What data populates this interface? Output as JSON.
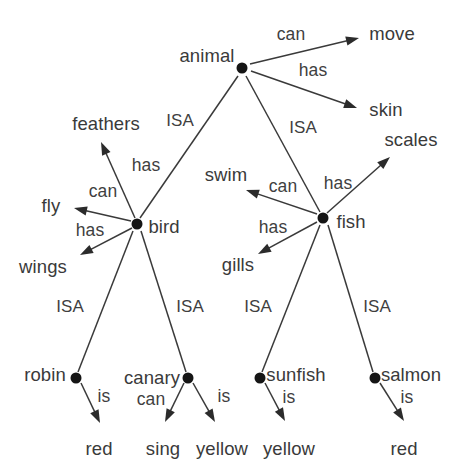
{
  "diagram": {
    "type": "semantic-network",
    "title": "",
    "background_color": "#ffffff",
    "line_color": "#3a3a3a",
    "node_color": "#151515",
    "text_color": "#3b3b3b",
    "nodes": [
      {
        "id": "animal",
        "label": "animal",
        "x": 242,
        "y": 68,
        "label_x": 207,
        "label_y": 56,
        "has_dot": true
      },
      {
        "id": "bird",
        "label": "bird",
        "x": 137,
        "y": 224,
        "label_x": 164,
        "label_y": 227,
        "has_dot": true
      },
      {
        "id": "fish",
        "label": "fish",
        "x": 323,
        "y": 218,
        "label_x": 351,
        "label_y": 222,
        "has_dot": true
      },
      {
        "id": "robin",
        "label": "robin",
        "x": 76,
        "y": 378,
        "label_x": 45,
        "label_y": 375,
        "has_dot": true
      },
      {
        "id": "canary",
        "label": "canary",
        "x": 188,
        "y": 378,
        "label_x": 152,
        "label_y": 378,
        "has_dot": true
      },
      {
        "id": "sunfish",
        "label": "sunfish",
        "x": 260,
        "y": 378,
        "label_x": 296,
        "label_y": 375,
        "has_dot": true
      },
      {
        "id": "salmon",
        "label": "salmon",
        "x": 375,
        "y": 378,
        "label_x": 411,
        "label_y": 375,
        "has_dot": true
      }
    ],
    "attributes": [
      {
        "id": "move",
        "label": "move",
        "label_x": 392,
        "label_y": 34,
        "arrow_x": 359,
        "arrow_y": 38
      },
      {
        "id": "skin",
        "label": "skin",
        "label_x": 386,
        "label_y": 110,
        "arrow_x": 357,
        "arrow_y": 108
      },
      {
        "id": "feathers",
        "label": "feathers",
        "label_x": 106,
        "label_y": 124,
        "arrow_x": 101,
        "arrow_y": 142
      },
      {
        "id": "scales",
        "label": "scales",
        "label_x": 411,
        "label_y": 140,
        "arrow_x": 390,
        "arrow_y": 157
      },
      {
        "id": "swim",
        "label": "swim",
        "label_x": 226,
        "label_y": 175,
        "arrow_x": 246,
        "arrow_y": 190
      },
      {
        "id": "fly",
        "label": "fly",
        "label_x": 51,
        "label_y": 206,
        "arrow_x": 74,
        "arrow_y": 208
      },
      {
        "id": "wings",
        "label": "wings",
        "label_x": 43,
        "label_y": 267,
        "arrow_x": 80,
        "arrow_y": 255
      },
      {
        "id": "gills",
        "label": "gills",
        "label_x": 238,
        "label_y": 265,
        "arrow_x": 258,
        "arrow_y": 254
      },
      {
        "id": "red1",
        "label": "red",
        "label_x": 99,
        "label_y": 449,
        "arrow_x": 100,
        "arrow_y": 423
      },
      {
        "id": "sing",
        "label": "sing",
        "label_x": 163,
        "label_y": 449,
        "arrow_x": 165,
        "arrow_y": 422
      },
      {
        "id": "yellow1",
        "label": "yellow",
        "label_x": 222,
        "label_y": 449,
        "arrow_x": 215,
        "arrow_y": 422
      },
      {
        "id": "yellow2",
        "label": "yellow",
        "label_x": 289,
        "label_y": 449,
        "arrow_x": 285,
        "arrow_y": 421
      },
      {
        "id": "red2",
        "label": "red",
        "label_x": 404,
        "label_y": 449,
        "arrow_x": 404,
        "arrow_y": 421
      }
    ],
    "edges": [
      {
        "id": "animal-can-move",
        "from": "animal",
        "to": "move",
        "relation": "can",
        "arrow": true,
        "x1": 250,
        "y1": 64,
        "x2": 359,
        "y2": 38,
        "label_x": 291,
        "label_y": 35
      },
      {
        "id": "animal-has-skin",
        "from": "animal",
        "to": "skin",
        "relation": "has",
        "arrow": true,
        "x1": 251,
        "y1": 71,
        "x2": 357,
        "y2": 108,
        "label_x": 313,
        "label_y": 71
      },
      {
        "id": "animal-isa-bird",
        "from": "animal",
        "to": "bird",
        "relation": "ISA",
        "arrow": false,
        "x1": 238,
        "y1": 76,
        "x2": 140,
        "y2": 218,
        "label_x": 180,
        "label_y": 120
      },
      {
        "id": "animal-isa-fish",
        "from": "animal",
        "to": "fish",
        "relation": "ISA",
        "arrow": false,
        "x1": 246,
        "y1": 76,
        "x2": 320,
        "y2": 212,
        "label_x": 303,
        "label_y": 127
      },
      {
        "id": "bird-has-feathers",
        "from": "bird",
        "to": "feathers",
        "relation": "has",
        "arrow": true,
        "x1": 135,
        "y1": 218,
        "x2": 101,
        "y2": 142,
        "label_x": 146,
        "label_y": 166
      },
      {
        "id": "bird-can-fly",
        "from": "bird",
        "to": "fly",
        "relation": "can",
        "arrow": true,
        "x1": 131,
        "y1": 221,
        "x2": 74,
        "y2": 208,
        "label_x": 103,
        "label_y": 192
      },
      {
        "id": "bird-has-wings",
        "from": "bird",
        "to": "wings",
        "relation": "has",
        "arrow": true,
        "x1": 132,
        "y1": 228,
        "x2": 80,
        "y2": 255,
        "label_x": 90,
        "label_y": 231
      },
      {
        "id": "bird-isa-robin",
        "from": "bird",
        "to": "robin",
        "relation": "ISA",
        "arrow": false,
        "x1": 133,
        "y1": 231,
        "x2": 78,
        "y2": 372,
        "label_x": 70,
        "label_y": 306
      },
      {
        "id": "bird-isa-canary",
        "from": "bird",
        "to": "canary",
        "relation": "ISA",
        "arrow": false,
        "x1": 141,
        "y1": 231,
        "x2": 186,
        "y2": 372,
        "label_x": 190,
        "label_y": 306
      },
      {
        "id": "fish-can-swim",
        "from": "fish",
        "to": "swim",
        "relation": "can",
        "arrow": true,
        "x1": 317,
        "y1": 214,
        "x2": 246,
        "y2": 190,
        "label_x": 283,
        "label_y": 187
      },
      {
        "id": "fish-has-scales",
        "from": "fish",
        "to": "scales",
        "relation": "has",
        "arrow": true,
        "x1": 327,
        "y1": 213,
        "x2": 390,
        "y2": 157,
        "label_x": 338,
        "label_y": 184
      },
      {
        "id": "fish-has-gills",
        "from": "fish",
        "to": "gills",
        "relation": "has",
        "arrow": true,
        "x1": 317,
        "y1": 222,
        "x2": 258,
        "y2": 254,
        "label_x": 273,
        "label_y": 228
      },
      {
        "id": "fish-isa-sunfish",
        "from": "fish",
        "to": "sunfish",
        "relation": "ISA",
        "arrow": false,
        "x1": 320,
        "y1": 225,
        "x2": 262,
        "y2": 372,
        "label_x": 258,
        "label_y": 306
      },
      {
        "id": "fish-isa-salmon",
        "from": "fish",
        "to": "salmon",
        "relation": "ISA",
        "arrow": false,
        "x1": 328,
        "y1": 225,
        "x2": 373,
        "y2": 372,
        "label_x": 377,
        "label_y": 306
      },
      {
        "id": "robin-is-red",
        "from": "robin",
        "to": "red1",
        "relation": "is",
        "arrow": true,
        "x1": 81,
        "y1": 383,
        "x2": 100,
        "y2": 423,
        "label_x": 104,
        "label_y": 397
      },
      {
        "id": "canary-can-sing",
        "from": "canary",
        "to": "sing",
        "relation": "can",
        "arrow": true,
        "x1": 184,
        "y1": 383,
        "x2": 165,
        "y2": 422,
        "label_x": 151,
        "label_y": 400
      },
      {
        "id": "canary-is-yellow",
        "from": "canary",
        "to": "yellow1",
        "relation": "is",
        "arrow": true,
        "x1": 193,
        "y1": 383,
        "x2": 215,
        "y2": 422,
        "label_x": 224,
        "label_y": 397
      },
      {
        "id": "sunfish-is-yellow",
        "from": "sunfish",
        "to": "yellow2",
        "relation": "is",
        "arrow": true,
        "x1": 265,
        "y1": 383,
        "x2": 285,
        "y2": 421,
        "label_x": 289,
        "label_y": 398
      },
      {
        "id": "salmon-is-red",
        "from": "salmon",
        "to": "red2",
        "relation": "is",
        "arrow": true,
        "x1": 380,
        "y1": 383,
        "x2": 404,
        "y2": 421,
        "label_x": 407,
        "label_y": 398
      }
    ]
  }
}
